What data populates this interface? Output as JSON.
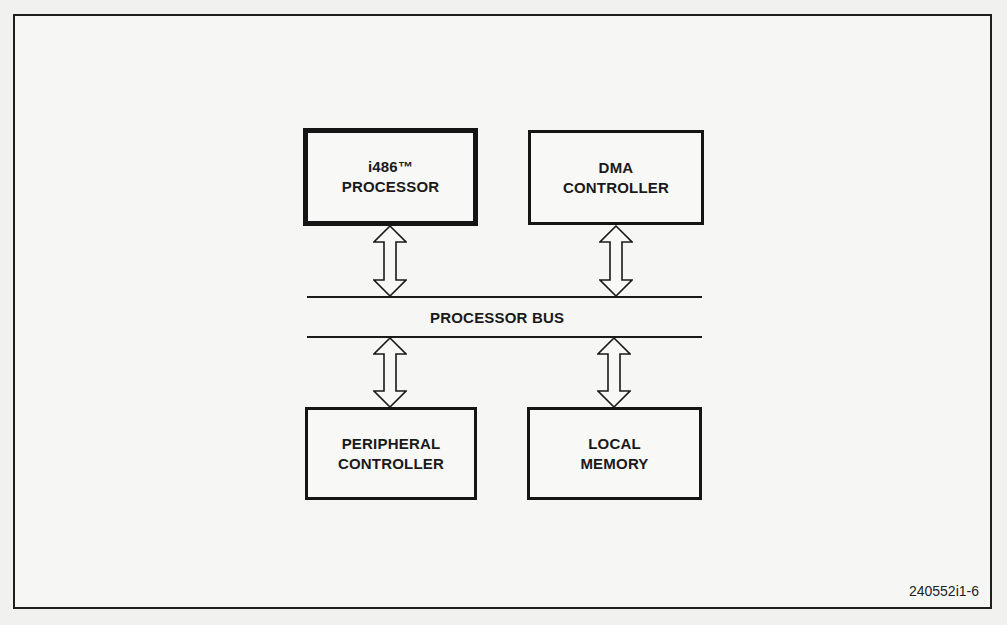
{
  "diagram": {
    "blocks": {
      "processor": {
        "line1": "i486™",
        "line2": "PROCESSOR"
      },
      "dma": {
        "line1": "DMA",
        "line2": "CONTROLLER"
      },
      "peripheral": {
        "line1": "PERIPHERAL",
        "line2": "CONTROLLER"
      },
      "memory": {
        "line1": "LOCAL",
        "line2": "MEMORY"
      }
    },
    "bus": {
      "label": "PROCESSOR BUS"
    },
    "connections": [
      {
        "from": "processor",
        "to": "bus",
        "type": "bidirectional"
      },
      {
        "from": "dma",
        "to": "bus",
        "type": "bidirectional"
      },
      {
        "from": "bus",
        "to": "peripheral",
        "type": "bidirectional"
      },
      {
        "from": "bus",
        "to": "memory",
        "type": "bidirectional"
      }
    ],
    "figure_id": "240552i1-6"
  }
}
